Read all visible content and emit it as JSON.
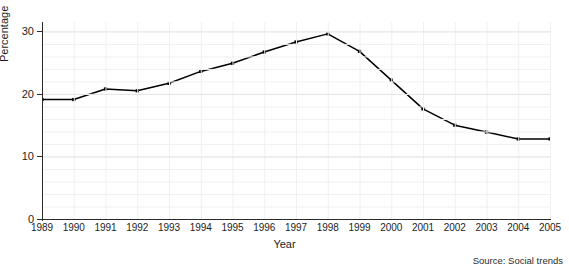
{
  "figure": {
    "title_sliver": "",
    "source_note": "Source: Social trends",
    "background_color": "#ffffff",
    "line_color": "#000000",
    "marker_color": "#000000",
    "grid_color": "#f0f0f2",
    "axis_color": "#2b2b2b"
  },
  "chart_data": {
    "type": "line",
    "title": "",
    "xlabel": "Year",
    "ylabel": "Percentage",
    "categories": [
      "1989",
      "1990",
      "1991",
      "1992",
      "1993",
      "1994",
      "1995",
      "1996",
      "1997",
      "1998",
      "1999",
      "2000",
      "2001",
      "2002",
      "2003",
      "2004",
      "2005"
    ],
    "x": [
      1989,
      1990,
      1991,
      1992,
      1993,
      1994,
      1995,
      1996,
      1997,
      1998,
      1999,
      2000,
      2001,
      2002,
      2003,
      2004,
      2005
    ],
    "values": [
      19.1,
      19.1,
      20.8,
      20.5,
      21.7,
      23.6,
      24.9,
      26.7,
      28.3,
      29.6,
      26.8,
      22.2,
      17.6,
      15.0,
      13.9,
      12.8,
      12.8
    ],
    "series": [
      {
        "name": "Percentage",
        "values": [
          19.1,
          19.1,
          20.8,
          20.5,
          21.7,
          23.6,
          24.9,
          26.7,
          28.3,
          29.6,
          26.8,
          22.2,
          17.6,
          15.0,
          13.9,
          12.8,
          12.8
        ]
      }
    ],
    "ylim": [
      0,
      31.5
    ],
    "xlim": [
      1989,
      2005
    ],
    "yticks": [
      0,
      10,
      20,
      30
    ],
    "ytick_labels": [
      "0",
      "10",
      "20",
      "30"
    ],
    "xtick_labels": [
      "1989",
      "1990",
      "1991",
      "1992",
      "1993",
      "1994",
      "1995",
      "1996",
      "1997",
      "1998",
      "1999",
      "2000",
      "2001",
      "2002",
      "2003",
      "2004",
      "2005"
    ],
    "grid": true,
    "legend": false,
    "markers": "square",
    "annotations": [
      "Source: Social trends"
    ]
  }
}
